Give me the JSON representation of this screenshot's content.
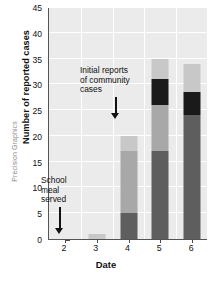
{
  "chart_data": {
    "type": "bar",
    "stacked": true,
    "title": "",
    "xlabel": "Date",
    "ylabel": "Number of reported cases",
    "categories": [
      "2",
      "3",
      "4",
      "5",
      "6"
    ],
    "ylim": [
      0,
      45
    ],
    "y_ticks": [
      0,
      5,
      10,
      15,
      20,
      25,
      30,
      35,
      40,
      45
    ],
    "grid": true,
    "legend_position": "none",
    "series": [
      {
        "name": "dark-gray",
        "color": "#5e5e5e",
        "values": [
          0,
          0,
          5,
          17,
          24
        ]
      },
      {
        "name": "medium-gray",
        "color": "#a8a8a8",
        "values": [
          0,
          0,
          12,
          9,
          0
        ]
      },
      {
        "name": "black",
        "color": "#1a1a1a",
        "values": [
          0,
          0,
          0,
          5,
          4.5
        ]
      },
      {
        "name": "light-gray",
        "color": "#c8c8c8",
        "values": [
          0,
          1,
          3,
          4,
          5.5
        ]
      }
    ],
    "totals": [
      0,
      1,
      20,
      35,
      34
    ],
    "annotations": [
      {
        "id": "community",
        "lines": [
          "Initial reports",
          "of community",
          "cases"
        ],
        "points_to_category": "4",
        "arrow": "down"
      },
      {
        "id": "school",
        "lines": [
          "School",
          "meal",
          "served"
        ],
        "points_to_category": "2",
        "arrow": "down"
      }
    ]
  },
  "credit": "Precision Graphics",
  "colors": {
    "plot_background": "#ebebeb",
    "gridline": "#ffffff",
    "axis": "#555555",
    "text": "#111111"
  }
}
